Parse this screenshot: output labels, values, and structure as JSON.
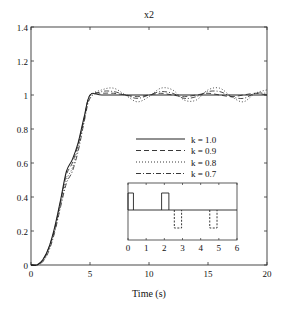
{
  "chart_data": {
    "type": "line",
    "title": "x2",
    "xlabel": "Time (s)",
    "ylabel": "",
    "xlim": [
      0,
      20
    ],
    "ylim": [
      0,
      1.4
    ],
    "xticks": [
      0,
      5,
      10,
      15,
      20
    ],
    "yticks": [
      0,
      0.2,
      0.4,
      0.6,
      0.8,
      1,
      1.2,
      1.4
    ],
    "xtick_labels": [
      "0",
      "5",
      "10",
      "15",
      "20"
    ],
    "ytick_labels": [
      "0",
      "0.2",
      "0.4",
      "0.6",
      "0.8",
      "1",
      "1.2",
      "1.4"
    ],
    "grid": false,
    "legend_position": "center-right",
    "series": [
      {
        "name": "k = 1.0",
        "style": "solid",
        "x": [
          0,
          0.5,
          1,
          1.5,
          2,
          2.5,
          3,
          3.5,
          4,
          4.5,
          5,
          6,
          8,
          10,
          12,
          14,
          16,
          18,
          20
        ],
        "y": [
          0,
          0.0,
          0.03,
          0.1,
          0.22,
          0.38,
          0.55,
          0.62,
          0.72,
          0.87,
          1.0,
          1.0,
          1.0,
          1.0,
          1.0,
          1.0,
          1.0,
          1.0,
          1.0
        ]
      },
      {
        "name": "k = 0.9",
        "style": "dashed",
        "x": [
          0,
          0.5,
          1,
          1.5,
          2,
          2.5,
          3,
          3.5,
          4,
          4.5,
          5,
          6,
          7,
          8,
          9,
          10,
          11,
          12,
          13,
          14,
          15,
          16,
          17,
          18,
          19,
          20
        ],
        "y": [
          0,
          0.0,
          0.03,
          0.1,
          0.21,
          0.37,
          0.53,
          0.6,
          0.71,
          0.86,
          1.0,
          1.01,
          1.01,
          1.0,
          0.99,
          1.0,
          1.01,
          1.0,
          0.99,
          1.0,
          1.01,
          1.0,
          0.99,
          1.0,
          1.01,
          1.0
        ]
      },
      {
        "name": "k = 0.8",
        "style": "dotted",
        "x": [
          0,
          0.5,
          1,
          1.5,
          2,
          2.5,
          3,
          3.5,
          4,
          4.5,
          5,
          6,
          7,
          8,
          9,
          10,
          11,
          12,
          13,
          14,
          15,
          16,
          17,
          18,
          19,
          20
        ],
        "y": [
          0,
          0.0,
          0.02,
          0.09,
          0.2,
          0.35,
          0.5,
          0.57,
          0.69,
          0.85,
          0.99,
          1.03,
          1.04,
          1.0,
          0.96,
          0.99,
          1.04,
          1.03,
          0.97,
          0.97,
          1.03,
          1.04,
          0.99,
          0.96,
          1.01,
          1.03
        ]
      },
      {
        "name": "k = 0.7",
        "style": "dashdot",
        "x": [
          0,
          0.5,
          1,
          1.5,
          2,
          2.5,
          3,
          3.5,
          4,
          4.5,
          5,
          6,
          7,
          8,
          9,
          10,
          11,
          12,
          13,
          14,
          15,
          16,
          17,
          18,
          19,
          20
        ],
        "y": [
          0,
          0.0,
          0.02,
          0.08,
          0.19,
          0.34,
          0.48,
          0.55,
          0.67,
          0.84,
          0.98,
          1.02,
          1.02,
          1.0,
          0.98,
          1.0,
          1.02,
          1.01,
          0.98,
          0.99,
          1.02,
          1.02,
          0.99,
          0.98,
          1.01,
          1.01
        ]
      }
    ],
    "inset": {
      "xlim": [
        0,
        6
      ],
      "xticks": [
        0,
        1,
        2,
        3,
        4,
        5,
        6
      ],
      "xtick_labels": [
        "0",
        "1",
        "2",
        "3",
        "4",
        "5",
        "6"
      ],
      "series": [
        {
          "name": "upper pulses",
          "style": "solid",
          "pulses": [
            [
              0,
              0.3
            ],
            [
              1.85,
              2.25
            ]
          ]
        },
        {
          "name": "lower pulses",
          "style": "dashed",
          "pulses": [
            [
              2.55,
              2.95
            ],
            [
              4.5,
              4.9
            ]
          ]
        }
      ]
    }
  }
}
